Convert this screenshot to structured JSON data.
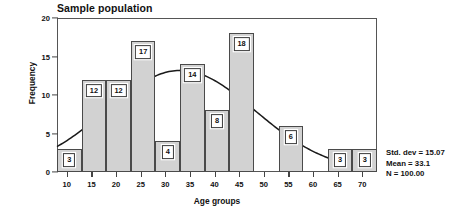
{
  "chart_data": {
    "type": "bar",
    "title": "Sample population",
    "xlabel": "Age groups",
    "ylabel": "Frequency",
    "xlim": [
      8,
      73
    ],
    "ylim": [
      0,
      20
    ],
    "xticks": [
      10,
      15,
      20,
      25,
      30,
      35,
      40,
      45,
      50,
      55,
      60,
      65,
      70
    ],
    "yticks": [
      0,
      5,
      10,
      15,
      20
    ],
    "grid": false,
    "legend": "none",
    "bin_width": 5,
    "bin_starts": [
      8,
      13,
      18,
      23,
      28,
      33,
      38,
      43,
      48,
      53,
      58,
      63,
      68
    ],
    "categories": [
      "8-13",
      "13-18",
      "18-23",
      "23-28",
      "28-33",
      "33-38",
      "38-43",
      "43-48",
      "48-53",
      "53-58",
      "58-63",
      "63-68",
      "68-73"
    ],
    "values": [
      3,
      12,
      12,
      17,
      4,
      14,
      8,
      18,
      0,
      6,
      0,
      3,
      3
    ],
    "bar_labels": [
      "3",
      "12",
      "12",
      "17",
      "4",
      "14",
      "8",
      "18",
      "",
      "6",
      "",
      "3",
      "3"
    ],
    "overlay": {
      "name": "normal curve",
      "type": "line",
      "mean": 33.1,
      "std_dev": 15.07,
      "n": 100.0,
      "peak_value": 13.2
    },
    "annotations": {
      "std_dev": "Std. dev = 15.07",
      "mean": "Mean = 33.1",
      "n": "N = 100.00"
    },
    "colors": {
      "bar_fill": "#d2d2d2",
      "bar_stroke": "#4a4a4a",
      "curve": "#1a1a1a",
      "axis": "#555555",
      "text": "#111111",
      "background": "#ffffff"
    }
  }
}
